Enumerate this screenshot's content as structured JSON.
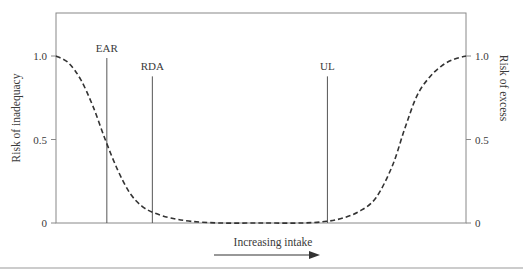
{
  "chart_data": {
    "type": "line",
    "title": "",
    "xlabel": "Increasing intake",
    "ylabel_left": "Risk of inadequacy",
    "ylabel_right": "Risk of excess",
    "ylim": [
      0,
      1.0
    ],
    "xlim": [
      0,
      1
    ],
    "y_ticks_left": [
      {
        "value": 0,
        "label": "0"
      },
      {
        "value": 0.5,
        "label": "0.5"
      },
      {
        "value": 1.0,
        "label": "1.0"
      }
    ],
    "y_ticks_right": [
      {
        "value": 0,
        "label": "0"
      },
      {
        "value": 0.5,
        "label": "0.5"
      },
      {
        "value": 1.0,
        "label": "1.0"
      }
    ],
    "reference_lines": [
      {
        "label": "EAR",
        "x": 0.124,
        "top": 1.0
      },
      {
        "label": "RDA",
        "x": 0.235,
        "top": 0.89
      },
      {
        "label": "UL",
        "x": 0.662,
        "top": 0.89
      }
    ],
    "series": [
      {
        "name": "Risk curve",
        "style": "dashed",
        "x": [
          0.0,
          0.03,
          0.06,
          0.09,
          0.12,
          0.15,
          0.18,
          0.21,
          0.24,
          0.28,
          0.33,
          0.4,
          0.5,
          0.6,
          0.66,
          0.7,
          0.74,
          0.78,
          0.82,
          0.85,
          0.88,
          0.91,
          0.94,
          0.97,
          1.0
        ],
        "values": [
          1.0,
          0.96,
          0.86,
          0.7,
          0.5,
          0.32,
          0.18,
          0.1,
          0.06,
          0.03,
          0.01,
          0.0,
          0.0,
          0.0,
          0.01,
          0.03,
          0.07,
          0.15,
          0.34,
          0.56,
          0.76,
          0.87,
          0.94,
          0.98,
          1.0
        ]
      }
    ],
    "grid": false,
    "legend": "none",
    "annotation_arrow": "right"
  }
}
